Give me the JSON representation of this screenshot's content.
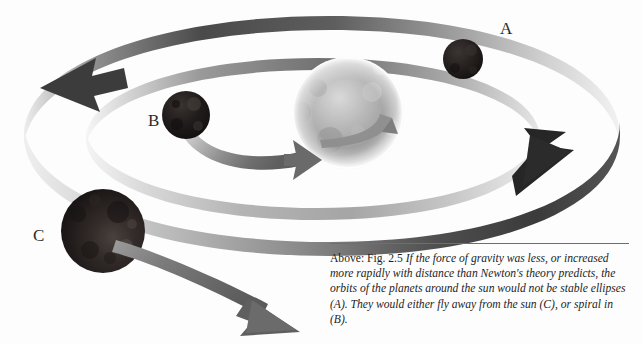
{
  "figure": {
    "background_color": "#fdfdfd"
  },
  "labels": [
    {
      "id": "A",
      "text": "A",
      "x": 500,
      "y": 20,
      "refers_to": "stable-ellipse-planet"
    },
    {
      "id": "B",
      "text": "B",
      "x": 148,
      "y": 112,
      "refers_to": "spiral-in-planet"
    },
    {
      "id": "C",
      "text": "C",
      "x": 33,
      "y": 227,
      "refers_to": "fly-away-planet"
    }
  ],
  "bodies": [
    {
      "name": "sun",
      "cx": 348,
      "cy": 113,
      "r": 56,
      "color": "#9a9a9a"
    },
    {
      "name": "planet-a",
      "cx": 463,
      "cy": 59,
      "r": 20,
      "color": "#241f1f"
    },
    {
      "name": "planet-b",
      "cx": 186,
      "cy": 115,
      "r": 24,
      "color": "#1d1a19"
    },
    {
      "name": "planet-c",
      "cx": 103,
      "cy": 231,
      "r": 42,
      "color": "#2a2524"
    }
  ],
  "orbits": [
    {
      "name": "outer-elliptical-orbit",
      "style": "ribbon",
      "arrow_at": [
        555,
        170
      ],
      "arrow_direction": "right"
    },
    {
      "name": "inner-elliptical-orbit",
      "style": "ribbon",
      "arrow_at": [
        68,
        78
      ],
      "arrow_direction": "left"
    },
    {
      "name": "spiral-in-path-b",
      "style": "ribbon",
      "arrow_at": [
        296,
        159
      ],
      "arrow_direction": "right"
    },
    {
      "name": "spiral-out-path-c",
      "style": "ribbon",
      "arrow_at": [
        283,
        323
      ],
      "arrow_direction": "down-right"
    }
  ],
  "caption": {
    "prefix": "Above: Fig. 2.5 ",
    "body": "If the force of gravity was less, or increased more rapidly with distance than Newton's theory predicts, the orbits of the planets around the sun would not be stable ellipses (A). They would either fly away from the sun (C), or spiral in (B).",
    "full_text": "Above: Fig. 2.5 If the force of gravity was less, or increased more rapidly with distance than Newton's theory predicts, the orbits of the planets around the sun would not be stable ellipses (A). They would either fly away from the sun (C), or spiral in (B)."
  },
  "colors": {
    "ribbon_dark": "#3a3a3a",
    "ribbon_light": "#e8e8e8",
    "arrow_dark": "#2c2c2c",
    "text": "#1e1e1e",
    "rule": "#6e6e6e"
  }
}
